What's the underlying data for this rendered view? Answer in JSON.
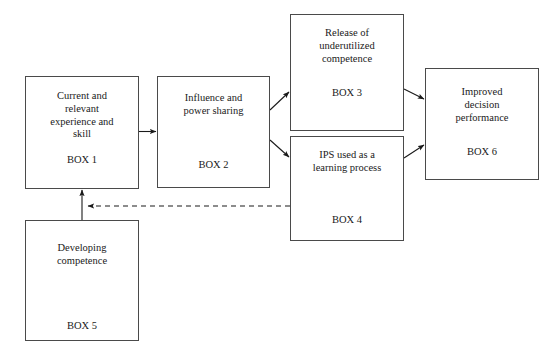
{
  "diagram": {
    "background_color": "#ffffff",
    "stroke_color": "#4a4a4a",
    "text_color": "#1a1a1a",
    "nodes": [
      {
        "id": "box1",
        "label": "Current and\nrelevant\nexperience and\nskill",
        "tag": "BOX 1"
      },
      {
        "id": "box2",
        "label": "Influence and\npower sharing",
        "tag": "BOX 2"
      },
      {
        "id": "box3",
        "label": "Release of\nunderutilized\ncompetence",
        "tag": "BOX 3"
      },
      {
        "id": "box4",
        "label": "IPS used as a\nlearning process",
        "tag": "BOX 4"
      },
      {
        "id": "box5",
        "label": "Developing\ncompetence",
        "tag": "BOX 5"
      },
      {
        "id": "box6",
        "label": "Improved\ndecision\nperformance",
        "tag": "BOX 6"
      }
    ],
    "edges": [
      {
        "id": "box1-to-box2",
        "from": "BOX 1",
        "to": "BOX 2",
        "style": "solid"
      },
      {
        "id": "box2-to-box3",
        "from": "BOX 2",
        "to": "BOX 3",
        "style": "solid"
      },
      {
        "id": "box2-to-box4",
        "from": "BOX 2",
        "to": "BOX 4",
        "style": "solid"
      },
      {
        "id": "box3-to-box6",
        "from": "BOX 3",
        "to": "BOX 6",
        "style": "solid"
      },
      {
        "id": "box4-to-box6",
        "from": "BOX 4",
        "to": "BOX 6",
        "style": "solid"
      },
      {
        "id": "box4-to-box1-feedback",
        "from": "BOX 4",
        "to": "BOX 1",
        "style": "dashed"
      },
      {
        "id": "box5-to-box1",
        "from": "BOX 5",
        "to": "BOX 1",
        "style": "solid"
      }
    ]
  }
}
